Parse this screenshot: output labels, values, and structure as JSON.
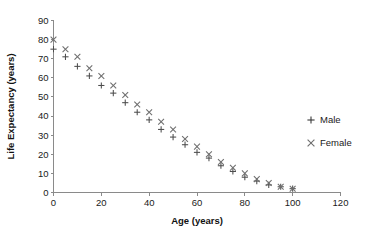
{
  "chart_data": {
    "type": "scatter",
    "title": "",
    "xlabel": "Age (years)",
    "ylabel": "Life Expectancy (years)",
    "xlim": [
      0,
      120
    ],
    "ylim": [
      0,
      90
    ],
    "xticks": [
      0,
      20,
      40,
      60,
      80,
      100,
      120
    ],
    "yticks": [
      0,
      10,
      20,
      30,
      40,
      50,
      60,
      70,
      80,
      90
    ],
    "grid": false,
    "legend_position": "right",
    "x": [
      0,
      5,
      10,
      15,
      20,
      25,
      30,
      35,
      40,
      45,
      50,
      55,
      60,
      65,
      70,
      75,
      80,
      85,
      90,
      95,
      100
    ],
    "series": [
      {
        "name": "Male",
        "marker": "plus",
        "color": "#4d4d4d",
        "values": [
          75,
          71,
          66,
          61,
          56,
          52,
          47,
          42,
          38,
          33,
          29,
          25,
          21,
          18,
          14,
          11,
          8,
          6,
          4,
          3,
          2
        ]
      },
      {
        "name": "Female",
        "marker": "cross",
        "color": "#6e6e6e",
        "values": [
          80,
          75,
          71,
          65,
          61,
          56,
          51,
          46,
          42,
          37,
          33,
          28,
          24,
          20,
          16,
          13,
          10,
          7,
          5,
          3,
          2
        ]
      }
    ]
  },
  "legend": {
    "entries": [
      {
        "label": "Male",
        "marker_icon": "plus-marker-icon"
      },
      {
        "label": "Female",
        "marker_icon": "cross-marker-icon"
      }
    ]
  }
}
